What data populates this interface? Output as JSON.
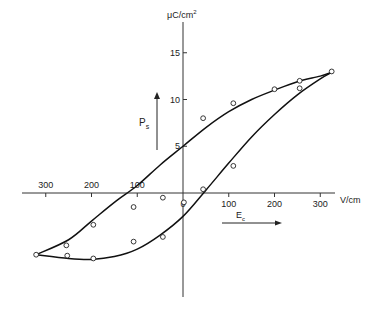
{
  "chart_data": {
    "type": "scatter",
    "title": "",
    "xlabel": "V/cm",
    "ylabel": "μC/cm²",
    "x_ticks": [
      300,
      200,
      100,
      0,
      100,
      200,
      300
    ],
    "x_tick_values": [
      -300,
      -200,
      -100,
      0,
      100,
      200,
      300
    ],
    "y_ticks": [
      5,
      10,
      15
    ],
    "xlim": [
      -330,
      330
    ],
    "ylim": [
      -10,
      17
    ],
    "grid": false,
    "legend": null,
    "annotations": [
      {
        "text": "P_s",
        "arrow": "up",
        "meaning": "spontaneous polarization"
      },
      {
        "text": "E_c",
        "arrow": "right",
        "meaning": "coercive field"
      }
    ],
    "series": [
      {
        "name": "upper-branch-curve",
        "kind": "line",
        "x": [
          -321,
          -250,
          -200,
          -150,
          -100,
          -50,
          0,
          50,
          100,
          150,
          200,
          250,
          300,
          325
        ],
        "y": [
          -6.6,
          -5.0,
          -3.0,
          -1.0,
          0.8,
          3.0,
          5.0,
          7.0,
          8.7,
          10.0,
          11.0,
          11.9,
          12.5,
          12.9
        ]
      },
      {
        "name": "lower-branch-curve",
        "kind": "line",
        "x": [
          -321,
          -250,
          -200,
          -150,
          -100,
          -50,
          0,
          50,
          100,
          150,
          200,
          250,
          300,
          325
        ],
        "y": [
          -6.6,
          -7.0,
          -7.1,
          -6.8,
          -6.0,
          -4.5,
          -2.5,
          0.3,
          3.2,
          6.0,
          8.4,
          10.5,
          12.2,
          12.9
        ]
      },
      {
        "name": "measured-points",
        "kind": "scatter",
        "x": [
          -321,
          -255,
          -253,
          -196,
          -196,
          -108,
          -108,
          -44,
          2,
          44,
          44,
          110,
          200,
          255,
          255,
          325,
          -44,
          110
        ],
        "y": [
          -6.6,
          -5.6,
          -6.7,
          -3.4,
          -7.0,
          -1.5,
          -5.2,
          -4.7,
          -1.0,
          8.0,
          0.4,
          9.6,
          11.1,
          12.0,
          11.2,
          13.0,
          -0.5,
          2.9
        ]
      }
    ]
  },
  "axes": {
    "x_unit": "V/cm",
    "y_unit_prefix": "μC/cm",
    "y_unit_sup": "2",
    "x_tick_labels": [
      "300",
      "200",
      "100",
      "0",
      "100",
      "200",
      "300"
    ],
    "y_tick_labels": [
      "5",
      "10",
      "15"
    ]
  },
  "annotations": {
    "ps_label": "P",
    "ps_sub": "s",
    "ec_label": "E",
    "ec_sub": "c"
  }
}
